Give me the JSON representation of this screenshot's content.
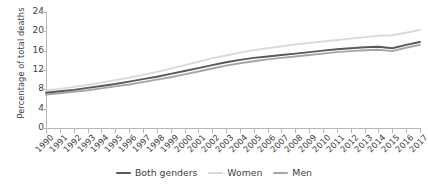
{
  "chart_data": {
    "type": "line",
    "title": "",
    "xlabel": "",
    "ylabel": "Percentage of total deaths",
    "ylim": [
      0,
      24
    ],
    "yticks": [
      0,
      4,
      8,
      12,
      16,
      20,
      24
    ],
    "grid": false,
    "legend_position": "bottom-center",
    "x": [
      1990,
      1991,
      1992,
      1993,
      1994,
      1995,
      1996,
      1997,
      1998,
      1999,
      2000,
      2001,
      2002,
      2003,
      2004,
      2005,
      2006,
      2007,
      2008,
      2009,
      2010,
      2011,
      2012,
      2013,
      2014,
      2015,
      2016,
      2017
    ],
    "categories": [
      "1990",
      "1991",
      "1992",
      "1993",
      "1994",
      "1995",
      "1996",
      "1997",
      "1998",
      "1999",
      "2000",
      "2001",
      "2002",
      "2003",
      "2004",
      "2005",
      "2006",
      "2007",
      "2008",
      "2009",
      "2010",
      "2011",
      "2012",
      "2013",
      "2014",
      "2015",
      "2016",
      "2017"
    ],
    "series": [
      {
        "name": "Both genders",
        "color": "#595959",
        "values": [
          7.3,
          7.6,
          7.9,
          8.3,
          8.7,
          9.1,
          9.6,
          10.1,
          10.6,
          11.2,
          11.8,
          12.4,
          13.0,
          13.6,
          14.1,
          14.5,
          14.8,
          15.1,
          15.4,
          15.7,
          16.0,
          16.3,
          16.5,
          16.7,
          16.8,
          16.5,
          17.2,
          17.8
        ]
      },
      {
        "name": "Women",
        "color": "#d9d9d9",
        "values": [
          7.8,
          8.1,
          8.5,
          8.9,
          9.4,
          9.9,
          10.4,
          11.0,
          11.6,
          12.3,
          13.0,
          13.7,
          14.4,
          15.0,
          15.6,
          16.1,
          16.5,
          16.9,
          17.3,
          17.6,
          17.9,
          18.2,
          18.5,
          18.8,
          19.1,
          19.2,
          19.7,
          20.3
        ]
      },
      {
        "name": "Men",
        "color": "#a6a6a6",
        "values": [
          6.9,
          7.2,
          7.5,
          7.8,
          8.2,
          8.6,
          9.0,
          9.5,
          10.0,
          10.5,
          11.1,
          11.7,
          12.3,
          12.9,
          13.4,
          13.8,
          14.2,
          14.5,
          14.8,
          15.1,
          15.4,
          15.7,
          15.9,
          16.1,
          16.2,
          15.9,
          16.6,
          17.2
        ]
      }
    ]
  },
  "legend": {
    "items": [
      {
        "label": "Both genders",
        "color": "#595959"
      },
      {
        "label": "Women",
        "color": "#d9d9d9"
      },
      {
        "label": "Men",
        "color": "#a6a6a6"
      }
    ]
  }
}
